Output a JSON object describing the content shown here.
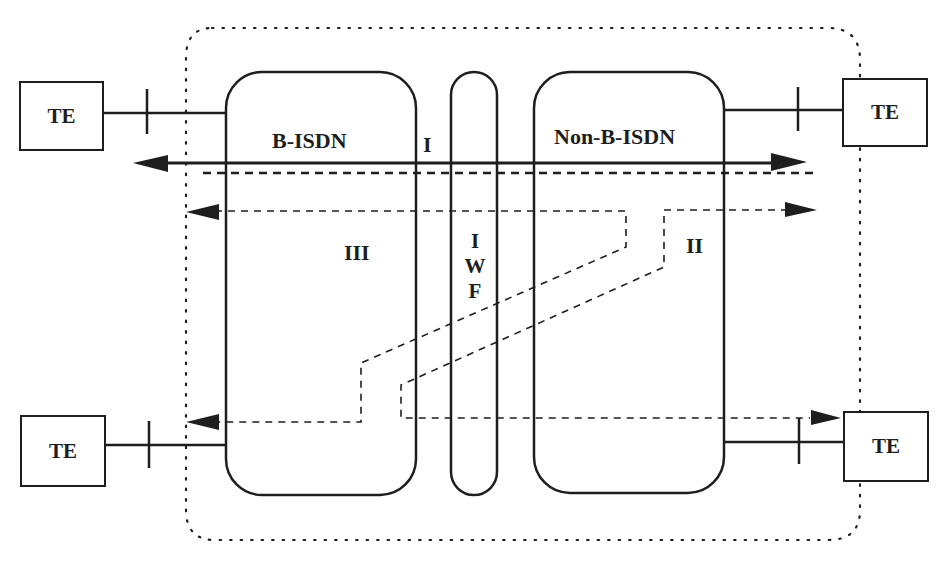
{
  "diagram": {
    "type": "network-interworking",
    "nodes": {
      "te_top_left": "TE",
      "te_top_right": "TE",
      "te_bottom_left": "TE",
      "te_bottom_right": "TE",
      "b_isdn": "B-ISDN",
      "non_b_isdn": "Non-B-ISDN",
      "iwf": [
        "I",
        "W",
        "F"
      ]
    },
    "paths": {
      "path_1": "I",
      "path_2": "II",
      "path_3": "III"
    },
    "colors": {
      "stroke": "#1e1e1e",
      "background": "#ffffff"
    }
  }
}
